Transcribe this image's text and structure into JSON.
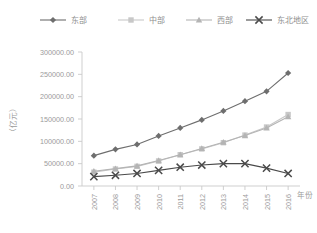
{
  "chart_data": {
    "type": "line",
    "title": "",
    "xlabel": "年份",
    "ylabel": "（亿元）",
    "x": [
      "2007",
      "2008",
      "2009",
      "2010",
      "2011",
      "2012",
      "2013",
      "2014",
      "2015",
      "2016"
    ],
    "categories": [
      "2007",
      "2008",
      "2009",
      "2010",
      "2011",
      "2012",
      "2013",
      "2014",
      "2015",
      "2016"
    ],
    "ylim": [
      0,
      300000
    ],
    "yticks": [
      0,
      50000,
      100000,
      150000,
      200000,
      250000,
      300000
    ],
    "ytick_labels": [
      "0.00",
      "50000.00",
      "100000.00",
      "150000.00",
      "200000.00",
      "250000.00",
      "300000.00"
    ],
    "grid": false,
    "legend_position": "top",
    "series": [
      {
        "name": "东部",
        "marker": "diamond",
        "color": "#6e6e6e",
        "values": [
          68000,
          82000,
          93000,
          112000,
          130000,
          148000,
          168000,
          190000,
          212000,
          253000
        ]
      },
      {
        "name": "中部",
        "marker": "square",
        "color": "#c8c8c8",
        "values": [
          31000,
          38000,
          44000,
          56000,
          70000,
          83000,
          97000,
          114000,
          132000,
          160000
        ]
      },
      {
        "name": "西部",
        "marker": "triangle",
        "color": "#b4b4b4",
        "values": [
          33000,
          39000,
          45000,
          57000,
          70000,
          84000,
          98000,
          113000,
          130000,
          155000
        ]
      },
      {
        "name": "东北地区",
        "marker": "x",
        "color": "#4a4a4a",
        "values": [
          21000,
          24000,
          28000,
          35000,
          42000,
          47000,
          50000,
          50000,
          40000,
          28000
        ]
      }
    ]
  },
  "legend": {
    "items": [
      {
        "label": "东部"
      },
      {
        "label": "中部"
      },
      {
        "label": "西部"
      },
      {
        "label": "东北地区"
      }
    ]
  },
  "axes": {
    "y_title": "（亿元）",
    "x_title": "年份"
  }
}
